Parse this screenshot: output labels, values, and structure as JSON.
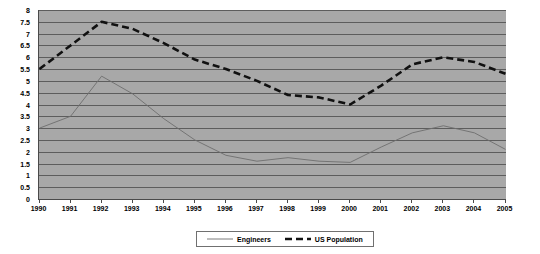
{
  "chart_data": {
    "type": "line",
    "title": "",
    "subtitle": "",
    "xlabel": "",
    "ylabel": "",
    "x": [
      1990,
      1991,
      1992,
      1993,
      1994,
      1995,
      1996,
      1997,
      1998,
      1999,
      2000,
      2001,
      2002,
      2003,
      2004,
      2005
    ],
    "categories": [
      "1990",
      "1991",
      "1992",
      "1993",
      "1994",
      "1995",
      "1996",
      "1997",
      "1998",
      "1999",
      "2000",
      "2001",
      "2002",
      "2003",
      "2004",
      "2005"
    ],
    "series": [
      {
        "name": "Engineers",
        "style": "solid",
        "color": "#6e6e6e",
        "width": 0.9,
        "values": [
          3.0,
          3.5,
          5.2,
          4.45,
          3.4,
          2.5,
          1.85,
          1.6,
          1.75,
          1.6,
          1.55,
          2.2,
          2.8,
          3.1,
          2.8,
          2.1
        ]
      },
      {
        "name": "US Population",
        "style": "dashed",
        "color": "#111111",
        "width": 2.6,
        "values": [
          5.5,
          6.5,
          7.5,
          7.2,
          6.6,
          5.9,
          5.5,
          5.0,
          4.4,
          4.3,
          4.0,
          4.8,
          5.7,
          6.0,
          5.8,
          5.3
        ]
      }
    ],
    "ylim": [
      0,
      8
    ],
    "ytick_step": 0.5,
    "yticks": [
      "8",
      "7.5",
      "7",
      "6.5",
      "6",
      "5.5",
      "5",
      "4.5",
      "4",
      "3.5",
      "3",
      "2.5",
      "2",
      "1.5",
      "1",
      "0.5",
      "0"
    ],
    "grid": {
      "horizontal": true,
      "vertical": false,
      "color": "#4a4a4a"
    },
    "plot_background": "#a8a8a8",
    "legend": {
      "position": "bottom",
      "entries": [
        "Engineers",
        "US Population"
      ]
    }
  }
}
